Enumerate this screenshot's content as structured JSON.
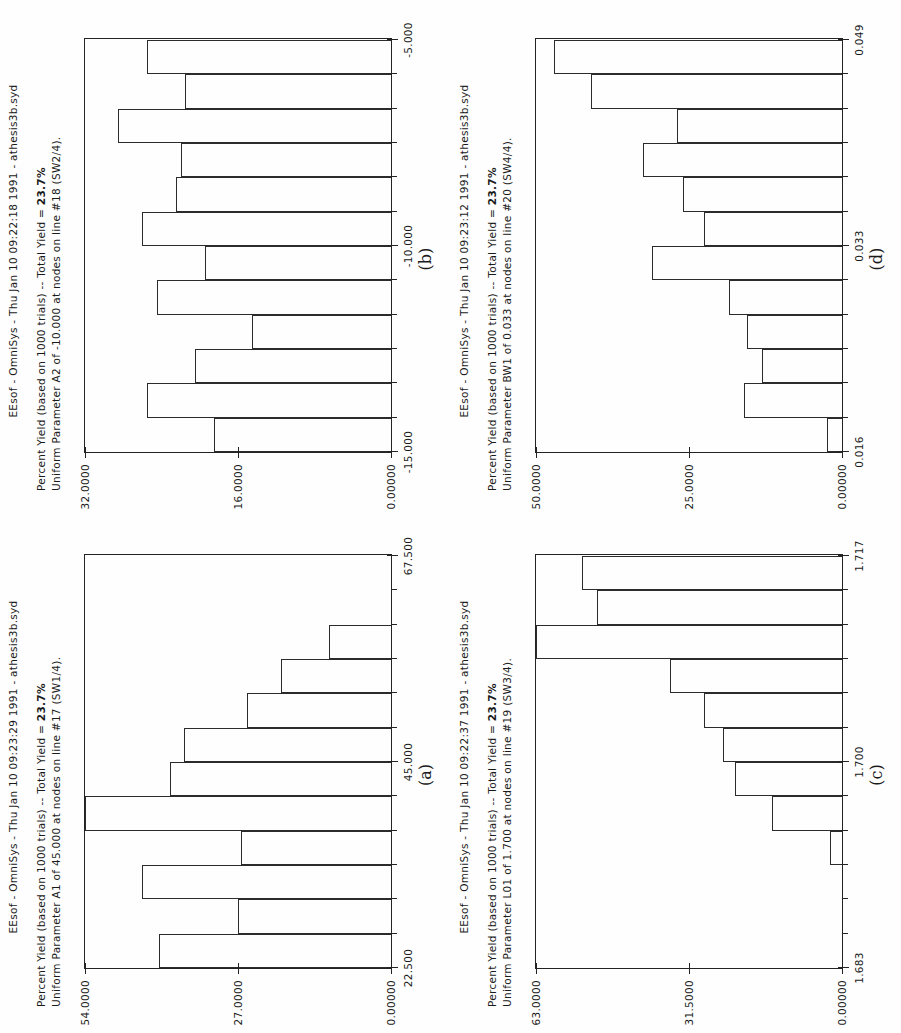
{
  "figure": {
    "panel_order": [
      "b",
      "a",
      "d",
      "c"
    ],
    "grid": "2x2",
    "orientation": "rotated-90-ccw",
    "line_color": "#232323",
    "background": "#ffffff"
  },
  "panels": {
    "a": {
      "caption": "(a)",
      "header": "EEsof - OmniSys - Thu Jan 10 09:23:29 1991 - athesis3b.syd",
      "sub_line1_prefix": "Percent Yield (based on 1000 trials) -- Total Yield = ",
      "sub_line1_pct": "23.7%",
      "sub_line2": "Uniform Parameter A1 of 45.000 at nodes  on line #17 (SW1/4).",
      "xlabels": [
        "22.500",
        "45.000",
        "67.500"
      ],
      "ylabels": [
        "0.00000",
        "27.0000",
        "54.0000"
      ]
    },
    "b": {
      "caption": "(b)",
      "header": "EEsof - OmniSys - Thu Jan 10 09:22:18 1991 - athesis3b.syd",
      "sub_line1_prefix": "Percent Yield (based on 1000 trials) -- Total Yield = ",
      "sub_line1_pct": "23.7%",
      "sub_line2": "Uniform Parameter A2 of -10.000 at nodes  on line #18 (SW2/4).",
      "xlabels": [
        "-15.000",
        "-10.000",
        "-5.000"
      ],
      "ylabels": [
        "0.00000",
        "16.0000",
        "32.0000"
      ]
    },
    "c": {
      "caption": "(c)",
      "header": "EEsof - OmniSys - Thu Jan 10 09:22:37 1991 - athesis3b.syd",
      "sub_line1_prefix": "Percent Yield (based on 1000 trials) -- Total Yield = ",
      "sub_line1_pct": "23.7%",
      "sub_line2": "Uniform Parameter L01 of 1.700 at nodes  on line #19 (SW3/4).",
      "xlabels": [
        "1.683",
        "1.700",
        "1.717"
      ],
      "ylabels": [
        "0.00000",
        "31.5000",
        "63.0000"
      ]
    },
    "d": {
      "caption": "(d)",
      "header": "EEsof - OmniSys - Thu Jan 10 09:23:12 1991 - athesis3b.syd",
      "sub_line1_prefix": "Percent Yield (based on 1000 trials) -- Total Yield = ",
      "sub_line1_pct": "23.7%",
      "sub_line2": "Uniform Parameter BW1 of 0.033 at nodes  on line #20 (SW4/4).",
      "xlabels": [
        "0.016",
        "0.033",
        "0.049"
      ],
      "ylabels": [
        "0.00000",
        "25.0000",
        "50.0000"
      ]
    }
  },
  "chart_data": [
    {
      "id": "a",
      "type": "bar",
      "title": "Percent Yield (based on 1000 trials) -- Total Yield = 23.7%",
      "subtitle": "Uniform Parameter A1 of 45.000 at nodes  on line #17 (SW1/4).",
      "header": "EEsof - OmniSys - Thu Jan 10 09:23:29 1991 - athesis3b.syd",
      "caption": "(a)",
      "xlabel": "Parameter A1",
      "ylabel": "Percent Yield",
      "xlim": [
        22.5,
        67.5
      ],
      "ylim": [
        0,
        54
      ],
      "xticks": [
        22.5,
        45.0,
        67.5
      ],
      "ytick_labels": [
        "0.00000",
        "27.0000",
        "54.0000"
      ],
      "grid": false,
      "legend": "none",
      "bin_count": 12,
      "categories": [
        "22.50-26.25",
        "26.25-30.00",
        "30.00-33.75",
        "33.75-37.50",
        "37.50-41.25",
        "41.25-45.00",
        "45.00-48.75",
        "48.75-52.50",
        "52.50-56.25",
        "56.25-60.00",
        "60.00-63.75",
        "63.75-67.50"
      ],
      "values": [
        41.0,
        27.0,
        44.0,
        26.5,
        54.0,
        39.0,
        36.5,
        25.5,
        19.5,
        11.0,
        0.0,
        0.0
      ]
    },
    {
      "id": "b",
      "type": "bar",
      "title": "Percent Yield (based on 1000 trials) -- Total Yield = 23.7%",
      "subtitle": "Uniform Parameter A2 of -10.000 at nodes  on line #18 (SW2/4).",
      "header": "EEsof - OmniSys - Thu Jan 10 09:22:18 1991 - athesis3b.syd",
      "caption": "(b)",
      "xlabel": "Parameter A2",
      "ylabel": "Percent Yield",
      "xlim": [
        -15.0,
        -5.0
      ],
      "ylim": [
        0,
        32
      ],
      "xticks": [
        -15.0,
        -10.0,
        -5.0
      ],
      "ytick_labels": [
        "0.00000",
        "16.0000",
        "32.0000"
      ],
      "grid": false,
      "legend": "none",
      "bin_count": 12,
      "categories": [
        "-15.00 to -14.17",
        "-14.17 to -13.33",
        "-13.33 to -12.50",
        "-12.50 to -11.67",
        "-11.67 to -10.83",
        "-10.83 to -10.00",
        "-10.00 to -9.17",
        "-9.17 to -8.33",
        "-8.33 to -7.50",
        "-7.50 to -6.67",
        "-6.67 to -5.83",
        "-5.83 to -5.00"
      ],
      "values": [
        18.5,
        25.5,
        20.5,
        14.5,
        24.5,
        19.5,
        26.0,
        22.5,
        22.0,
        28.5,
        21.5,
        25.5
      ]
    },
    {
      "id": "c",
      "type": "bar",
      "title": "Percent Yield (based on 1000 trials) -- Total Yield = 23.7%",
      "subtitle": "Uniform Parameter L01 of 1.700 at nodes  on line #19 (SW3/4).",
      "header": "EEsof - OmniSys - Thu Jan 10 09:22:37 1991 - athesis3b.syd",
      "caption": "(c)",
      "xlabel": "Parameter L01",
      "ylabel": "Percent Yield",
      "xlim": [
        1.683,
        1.717
      ],
      "ylim": [
        0,
        63
      ],
      "xticks": [
        1.683,
        1.7,
        1.717
      ],
      "ytick_labels": [
        "0.00000",
        "31.5000",
        "63.0000"
      ],
      "grid": false,
      "legend": "none",
      "bin_count": 12,
      "categories": [
        "1.6830-1.6858",
        "1.6858-1.6887",
        "1.6887-1.6915",
        "1.6915-1.6943",
        "1.6943-1.6972",
        "1.6972-1.7000",
        "1.7000-1.7028",
        "1.7028-1.7057",
        "1.7057-1.7085",
        "1.7085-1.7113",
        "1.7113-1.7142",
        "1.7142-1.7170"
      ],
      "values": [
        0.0,
        0.0,
        0.0,
        2.5,
        14.5,
        22.0,
        24.5,
        28.5,
        35.5,
        63.0,
        50.5,
        53.5
      ]
    },
    {
      "id": "d",
      "type": "bar",
      "title": "Percent Yield (based on 1000 trials) -- Total Yield = 23.7%",
      "subtitle": "Uniform Parameter BW1 of 0.033 at nodes  on line #20 (SW4/4).",
      "header": "EEsof - OmniSys - Thu Jan 10 09:23:12 1991 - athesis3b.syd",
      "caption": "(d)",
      "xlabel": "Parameter BW1",
      "ylabel": "Percent Yield",
      "xlim": [
        0.016,
        0.049
      ],
      "ylim": [
        0,
        50
      ],
      "xticks": [
        0.016,
        0.033,
        0.049
      ],
      "ytick_labels": [
        "0.00000",
        "25.0000",
        "50.0000"
      ],
      "grid": false,
      "legend": "none",
      "bin_count": 12,
      "categories": [
        "0.0160-0.0188",
        "0.0188-0.0215",
        "0.0215-0.0243",
        "0.0243-0.0270",
        "0.0270-0.0298",
        "0.0298-0.0325",
        "0.0325-0.0353",
        "0.0353-0.0380",
        "0.0380-0.0408",
        "0.0408-0.0435",
        "0.0435-0.0463",
        "0.0463-0.0490"
      ],
      "values": [
        2.5,
        16.0,
        13.0,
        15.5,
        18.5,
        31.0,
        22.5,
        26.0,
        32.5,
        27.0,
        41.0,
        47.0
      ]
    }
  ]
}
